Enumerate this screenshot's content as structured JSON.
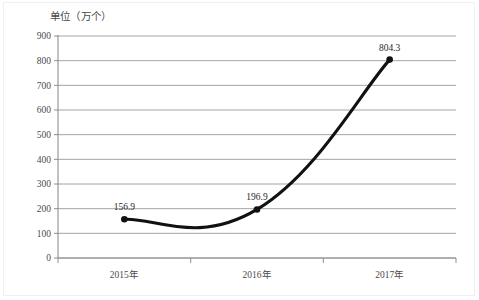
{
  "unit_title": "单位（万个）",
  "chart_data": {
    "type": "line",
    "title": "",
    "subtitle": "",
    "xlabel": "",
    "ylabel": "单位（万个）",
    "categories": [
      "2015年",
      "2016年",
      "2017年"
    ],
    "values": [
      156.9,
      196.9,
      804.3
    ],
    "data_labels": [
      "156.9",
      "196.9",
      "804.3"
    ],
    "series": [
      {
        "name": "",
        "values": [
          156.9,
          196.9,
          804.3
        ]
      }
    ],
    "ylim": [
      0,
      900
    ],
    "ytick_step": 100,
    "ytick_labels": [
      "0",
      "100",
      "200",
      "300",
      "400",
      "500",
      "600",
      "700",
      "800",
      "900"
    ],
    "ytick_values": [
      0,
      100,
      200,
      300,
      400,
      500,
      600,
      700,
      800,
      900
    ],
    "xtick_labels": [
      "2015年",
      "2016年",
      "2017年"
    ],
    "grid": true,
    "grid_orientation": "horizontal",
    "legend": false,
    "legend_position": "none",
    "smoothing": "spline",
    "marker": "circle",
    "line_color": "#111111",
    "grid_color": "#9a9a9a",
    "axis_color": "#8e8e8e",
    "annotations": []
  }
}
